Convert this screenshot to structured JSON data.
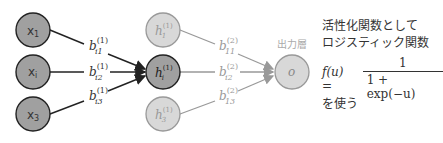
{
  "diagram": {
    "input_nodes": [
      {
        "label": "x",
        "sub": "1"
      },
      {
        "label": "x",
        "sub": "i"
      },
      {
        "label": "x",
        "sub": "3"
      }
    ],
    "hidden_nodes": [
      {
        "label": "h",
        "sub": "1",
        "sup": "(1)",
        "active": false
      },
      {
        "label": "h",
        "sub": "i",
        "sup": "(1)",
        "active": true
      },
      {
        "label": "h",
        "sub": "3",
        "sup": "(1)",
        "active": false
      }
    ],
    "output_node": {
      "label": "o",
      "title": "出力層"
    },
    "weights_layer1": [
      {
        "label": "b",
        "sub": "i1",
        "sup": "(1)"
      },
      {
        "label": "b",
        "sub": "i2",
        "sup": "(1)"
      },
      {
        "label": "b",
        "sub": "i3",
        "sup": "(1)"
      }
    ],
    "weights_layer2": [
      {
        "label": "b",
        "sub": "11",
        "sup": "(2)"
      },
      {
        "label": "b",
        "sub": "i2",
        "sup": "(2)"
      },
      {
        "label": "b",
        "sub": "13",
        "sup": "(2)"
      }
    ],
    "colors": {
      "active_fill": "#a0a0a0",
      "active_stroke": "#222222",
      "inactive_fill": "#d8d8d8",
      "inactive_stroke": "#999999"
    }
  },
  "note": {
    "line1": "活性化関数として",
    "line2": "ロジスティック関数",
    "formula_lhs": "f(u) =",
    "formula_num": "1",
    "formula_den": "1 + exp(−u)",
    "footer": "を使う"
  }
}
